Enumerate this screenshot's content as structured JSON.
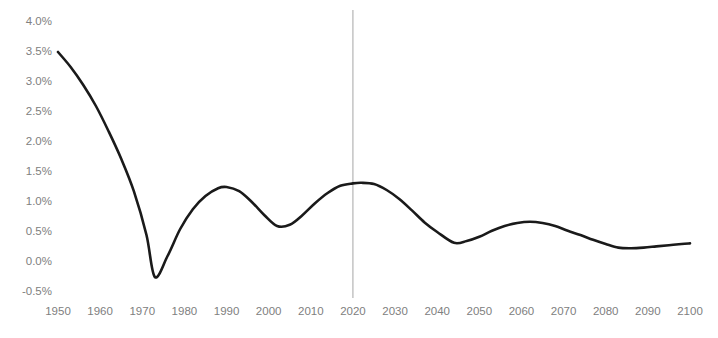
{
  "chart_data": {
    "type": "line",
    "title": "",
    "subtitle": "",
    "xlabel": "",
    "ylabel": "",
    "xlim": [
      1950,
      2100
    ],
    "ylim": [
      -0.5,
      4.0
    ],
    "grid": false,
    "legend": "none",
    "y_tick_labels": [
      "4.0%",
      "3.5%",
      "3.0%",
      "2.5%",
      "2.0%",
      "1.5%",
      "1.0%",
      "0.5%",
      "0.0%",
      "-0.5%"
    ],
    "y_tick_values": [
      4.0,
      3.5,
      3.0,
      2.5,
      2.0,
      1.5,
      1.0,
      0.5,
      0.0,
      -0.5
    ],
    "x_tick_labels": [
      "1950",
      "1960",
      "1970",
      "1980",
      "1990",
      "2000",
      "2010",
      "2020",
      "2030",
      "2040",
      "2050",
      "2060",
      "2070",
      "2080",
      "2090",
      "2100"
    ],
    "x_tick_values": [
      1950,
      1960,
      1970,
      1980,
      1990,
      2000,
      2010,
      2020,
      2030,
      2040,
      2050,
      2060,
      2070,
      2080,
      2090,
      2100
    ],
    "annotations": [
      {
        "type": "vertical-line",
        "x": 2020,
        "color": "#a6a6a6",
        "label": ""
      }
    ],
    "series": [
      {
        "name": "Growth rate",
        "color": "#1a1a1a",
        "line_width": 2.6,
        "x": [
          1950,
          1953,
          1956,
          1959,
          1962,
          1965,
          1968,
          1971,
          1973,
          1976,
          1979,
          1982,
          1985,
          1988,
          1990,
          1993,
          1996,
          1999,
          2002,
          2005,
          2008,
          2011,
          2014,
          2017,
          2020,
          2022,
          2025,
          2028,
          2031,
          2034,
          2037,
          2040,
          2044,
          2047,
          2050,
          2053,
          2056,
          2059,
          2062,
          2065,
          2068,
          2071,
          2074,
          2077,
          2080,
          2083,
          2086,
          2089,
          2092,
          2095,
          2098,
          2100
        ],
        "y": [
          3.5,
          3.25,
          2.95,
          2.6,
          2.18,
          1.72,
          1.18,
          0.45,
          -0.25,
          0.1,
          0.55,
          0.88,
          1.1,
          1.23,
          1.25,
          1.18,
          1.0,
          0.78,
          0.6,
          0.62,
          0.78,
          0.98,
          1.15,
          1.27,
          1.31,
          1.32,
          1.3,
          1.2,
          1.05,
          0.86,
          0.66,
          0.5,
          0.32,
          0.35,
          0.42,
          0.52,
          0.6,
          0.65,
          0.67,
          0.65,
          0.6,
          0.52,
          0.45,
          0.37,
          0.3,
          0.24,
          0.23,
          0.24,
          0.26,
          0.28,
          0.3,
          0.31
        ]
      }
    ]
  },
  "axes": {
    "y_axis_name": "y-axis",
    "x_axis_name": "x-axis"
  }
}
